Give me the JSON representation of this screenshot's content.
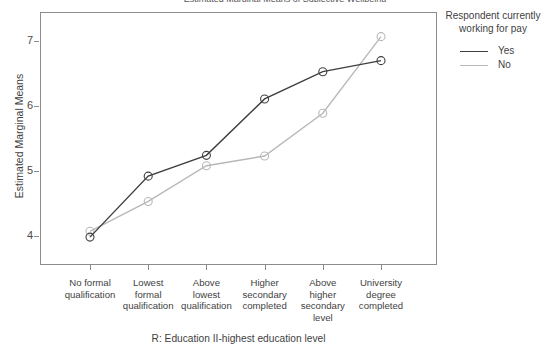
{
  "chart_data": {
    "type": "line",
    "title": "Estimated Marginal Means of Subjective Wellbeing",
    "xlabel": "R: Education II-highest education level",
    "ylabel": "Estimated Marginal Means",
    "categories": [
      "No formal qualification",
      "Lowest formal qualification",
      "Above lowest qualification",
      "Higher secondary completed",
      "Above higher secondary level",
      "University degree completed"
    ],
    "ylim": [
      3.55,
      7.45
    ],
    "yticks": [
      4,
      5,
      6,
      7
    ],
    "ytick_labels": [
      "4",
      "5",
      "6",
      "7"
    ],
    "grid": false,
    "legend_position": "right",
    "legend_title": "Respondent currently working for pay",
    "series": [
      {
        "name": "Yes",
        "color": "#3f3f3f",
        "marker": "open-circle",
        "values": [
          3.98,
          4.92,
          5.24,
          6.11,
          6.53,
          6.7
        ]
      },
      {
        "name": "No",
        "color": "#b8b8b8",
        "marker": "open-circle",
        "values": [
          4.07,
          4.53,
          5.08,
          5.23,
          5.89,
          7.07
        ]
      }
    ]
  },
  "legend": {
    "title_line1": "Respondent currently",
    "title_line2": "working for pay",
    "items": [
      {
        "label": "Yes",
        "color": "#3f3f3f"
      },
      {
        "label": "No",
        "color": "#b8b8b8"
      }
    ]
  },
  "axes": {
    "y_title": "Estimated Marginal Means",
    "x_title": "R: Education II-highest education level",
    "y_ticks": [
      {
        "label": "7",
        "value": 7
      },
      {
        "label": "6",
        "value": 6
      },
      {
        "label": "5",
        "value": 5
      },
      {
        "label": "4",
        "value": 4
      }
    ],
    "x_ticks": [
      {
        "line1": "No formal",
        "line2": "qualification",
        "line3": "",
        "line4": ""
      },
      {
        "line1": "Lowest",
        "line2": "formal",
        "line3": "qualification",
        "line4": ""
      },
      {
        "line1": "Above",
        "line2": "lowest",
        "line3": "qualification",
        "line4": ""
      },
      {
        "line1": "Higher",
        "line2": "secondary",
        "line3": "completed",
        "line4": ""
      },
      {
        "line1": "Above",
        "line2": "higher",
        "line3": "secondary",
        "line4": "level"
      },
      {
        "line1": "University",
        "line2": "degree",
        "line3": "completed",
        "line4": ""
      }
    ]
  },
  "title": {
    "text": "Estimated Marginal Means of Subjective Wellbeing"
  }
}
